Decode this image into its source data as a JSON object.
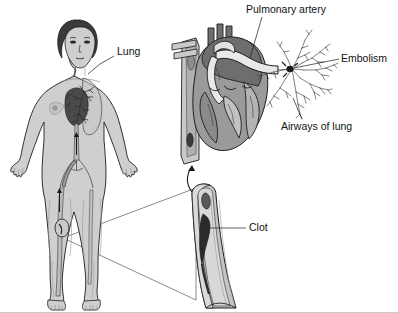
{
  "figure": {
    "background_color": "#ffffff",
    "line_color": "#1d1d1d",
    "bottom_border_color": "#c9c9c9"
  },
  "palette": {
    "skin": "#cfcfcf",
    "skin_shade": "#b4b4b4",
    "hair": "#3a3a3a",
    "heart_dark": "#6e6e6e",
    "heart_mid": "#9a9a9a",
    "heart_light": "#c2c2c2",
    "vessel_light": "#e6e6e6",
    "clot": "#2b2b2b",
    "vein_wall": "#b8b8b8",
    "vein_lumen": "#d6d6d6",
    "lung_tree": "#4a4a4a"
  },
  "labels": [
    {
      "id": "lung",
      "text": "Lung",
      "x": 117,
      "y": 52,
      "anchor": "start",
      "leader": "M 114 56 L 100 64 L 88 74"
    },
    {
      "id": "pulmonary-artery",
      "text": "Pulmonary artery",
      "x": 246,
      "y": 10,
      "anchor": "start",
      "leader": "M 262 17 L 250 58"
    },
    {
      "id": "embolism",
      "text": "Embolism",
      "x": 341,
      "y": 59,
      "anchor": "start",
      "leader": "M 339 59 L 292 69"
    },
    {
      "id": "airways-of-lung",
      "text": "Airways of lung",
      "x": 281,
      "y": 127,
      "anchor": "start",
      "leader": "M 300 120 L 292 98"
    },
    {
      "id": "clot",
      "text": "Clot",
      "x": 249,
      "y": 228,
      "anchor": "start",
      "leader": "M 246 228 L 205 228"
    }
  ],
  "panels": {
    "body_figure": {
      "name": "Full body anterior view with circulatory system",
      "callout_origin": {
        "x": 63,
        "y": 238
      }
    },
    "heart_section": {
      "name": "Heart cross-section with pulmonary artery and bronchial tree"
    },
    "vein_detail": {
      "name": "Magnified cut-away vein segment containing clot"
    }
  },
  "magnification": {
    "from": {
      "x": 63,
      "y": 238
    },
    "to_top": {
      "x": 196,
      "y": 188
    },
    "to_bottom": {
      "x": 196,
      "y": 300
    }
  },
  "arrow_heart_to_vein": "M 196 170 C 192 178, 190 182, 196 192"
}
